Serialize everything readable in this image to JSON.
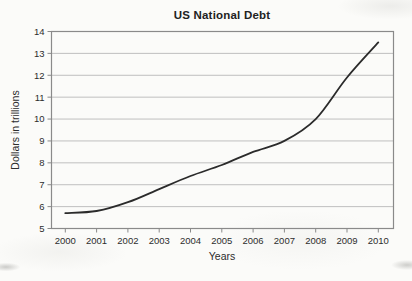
{
  "chart_data": {
    "type": "line",
    "title": "US National Debt",
    "xlabel": "Years",
    "ylabel": "Dollars in trillions",
    "x": [
      2000,
      2001,
      2002,
      2003,
      2004,
      2005,
      2006,
      2007,
      2008,
      2009,
      2010
    ],
    "values": [
      5.7,
      5.8,
      6.2,
      6.8,
      7.4,
      7.9,
      8.5,
      9.0,
      10.0,
      11.9,
      13.5
    ],
    "series_name": "US national debt (trillions of dollars)",
    "ylim": [
      5,
      14
    ],
    "y_ticks": [
      5,
      6,
      7,
      8,
      9,
      10,
      11,
      12,
      13,
      14
    ],
    "x_ticks": [
      "2000",
      "2001",
      "2002",
      "2003",
      "2004",
      "2005",
      "2006",
      "2007",
      "2008",
      "2009",
      "2010"
    ],
    "grid": "horizontal",
    "legend": "none",
    "colors": {
      "line": "#2b2b2b",
      "grid": "#bfbfbf",
      "axis": "#8a8a8a",
      "text": "#2d2d2d"
    }
  }
}
